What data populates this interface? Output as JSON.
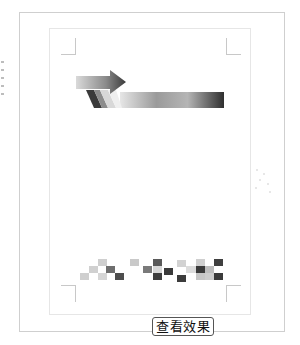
{
  "preview": {
    "button_label": "查看效果",
    "graphics": {
      "arrow_banner": "gradient-arrow-banner",
      "pixel_pattern": "grayscale-pixel-pattern"
    },
    "colors": {
      "frame_border": "#cfcfcf",
      "page_border": "#e6e6e6",
      "crop_mark": "#c8c8c8",
      "button_border": "#555555",
      "dark": "#3e3e3e",
      "mid": "#7a7a7a",
      "light": "#c9c9c9"
    },
    "pixel_cells": [
      {
        "x": 80,
        "y": 273,
        "c": "#cfcfcf"
      },
      {
        "x": 89,
        "y": 266,
        "c": "#d0d0d0"
      },
      {
        "x": 98,
        "y": 259,
        "c": "#cfcfcf"
      },
      {
        "x": 98,
        "y": 273,
        "c": "#d6d6d6"
      },
      {
        "x": 106,
        "y": 266,
        "c": "#6e6e6e"
      },
      {
        "x": 115,
        "y": 273,
        "c": "#4e4e4e"
      },
      {
        "x": 130,
        "y": 259,
        "c": "#c9c9c9"
      },
      {
        "x": 143,
        "y": 266,
        "c": "#7a7a7a"
      },
      {
        "x": 153,
        "y": 259,
        "c": "#5a5a5a"
      },
      {
        "x": 153,
        "y": 266,
        "c": "#d8d8d8"
      },
      {
        "x": 153,
        "y": 273,
        "c": "#3e3e3e"
      },
      {
        "x": 164,
        "y": 268,
        "c": "#3a3a3a"
      },
      {
        "x": 177,
        "y": 260,
        "c": "#d2d2d2"
      },
      {
        "x": 177,
        "y": 275,
        "c": "#3c3c3c"
      },
      {
        "x": 186,
        "y": 266,
        "c": "#dcdcdc"
      },
      {
        "x": 194,
        "y": 266,
        "c": "#dadada"
      },
      {
        "x": 196,
        "y": 259,
        "c": "#cfcfcf"
      },
      {
        "x": 196,
        "y": 266,
        "c": "#3a3a3a"
      },
      {
        "x": 196,
        "y": 273,
        "c": "#c6c6c6"
      },
      {
        "x": 205,
        "y": 266,
        "c": "#bdbdbd"
      },
      {
        "x": 205,
        "y": 273,
        "c": "#cdcdcd"
      },
      {
        "x": 214,
        "y": 259,
        "c": "#3f3f3f"
      },
      {
        "x": 214,
        "y": 273,
        "c": "#3b3b3b"
      }
    ]
  }
}
